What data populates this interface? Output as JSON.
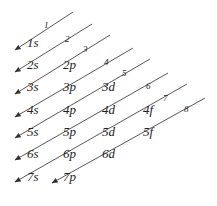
{
  "line_color": "#444444",
  "text_color": "#222222",
  "orbitals": [
    {
      "label": "1s",
      "x": 27,
      "y": 47
    },
    {
      "label": "2s",
      "x": 27,
      "y": 69
    },
    {
      "label": "2p",
      "x": 63,
      "y": 69
    },
    {
      "label": "3s",
      "x": 27,
      "y": 91
    },
    {
      "label": "3p",
      "x": 63,
      "y": 91
    },
    {
      "label": "3d",
      "x": 102,
      "y": 91
    },
    {
      "label": "4s",
      "x": 27,
      "y": 114
    },
    {
      "label": "4p",
      "x": 63,
      "y": 114
    },
    {
      "label": "4d",
      "x": 102,
      "y": 114
    },
    {
      "label": "4f",
      "x": 143,
      "y": 114
    },
    {
      "label": "5s",
      "x": 27,
      "y": 136
    },
    {
      "label": "5p",
      "x": 63,
      "y": 136
    },
    {
      "label": "5d",
      "x": 102,
      "y": 136
    },
    {
      "label": "5f",
      "x": 143,
      "y": 136
    },
    {
      "label": "6s",
      "x": 27,
      "y": 158
    },
    {
      "label": "6p",
      "x": 63,
      "y": 158
    },
    {
      "label": "6d",
      "x": 102,
      "y": 158
    },
    {
      "label": "7s",
      "x": 27,
      "y": 181
    },
    {
      "label": "7p",
      "x": 63,
      "y": 181
    }
  ],
  "diagonals": [
    {
      "n": "1",
      "x1": 73,
      "y1": 12,
      "x2": 15,
      "y2": 50,
      "nx": 44,
      "ny": 28
    },
    {
      "n": "2",
      "x1": 92,
      "y1": 24,
      "x2": 15,
      "y2": 72,
      "nx": 65,
      "ny": 42
    },
    {
      "n": "3",
      "x1": 110,
      "y1": 35,
      "x2": 15,
      "y2": 94,
      "nx": 83,
      "ny": 52
    },
    {
      "n": "4",
      "x1": 133,
      "y1": 48,
      "x2": 15,
      "y2": 117,
      "nx": 104,
      "ny": 65
    },
    {
      "n": "5",
      "x1": 150,
      "y1": 59,
      "x2": 15,
      "y2": 138,
      "nx": 122,
      "ny": 76
    },
    {
      "n": "6",
      "x1": 168,
      "y1": 73,
      "x2": 15,
      "y2": 160,
      "nx": 146,
      "ny": 89
    },
    {
      "n": "7",
      "x1": 187,
      "y1": 84,
      "x2": 15,
      "y2": 182,
      "nx": 163,
      "ny": 101
    },
    {
      "n": "8",
      "x1": 205,
      "y1": 98,
      "x2": 52,
      "y2": 183,
      "nx": 184,
      "ny": 112
    }
  ]
}
